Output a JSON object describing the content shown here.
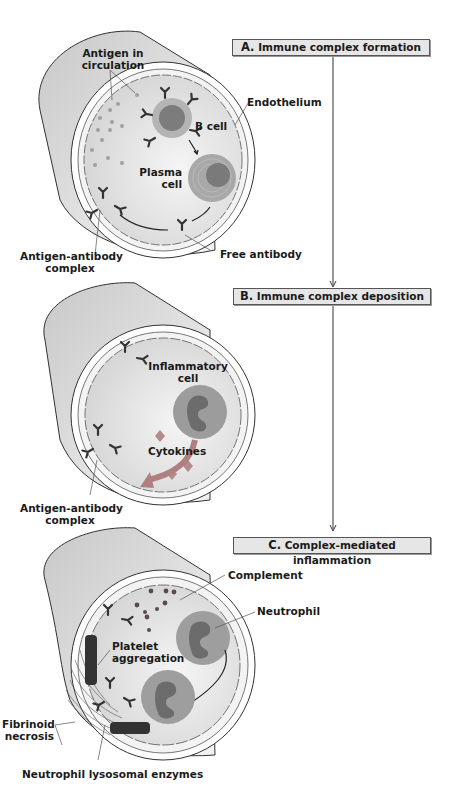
{
  "stages": [
    {
      "letter": "A.",
      "title": "Immune complex formation"
    },
    {
      "letter": "B.",
      "title": "Immune complex deposition"
    },
    {
      "letter": "C.",
      "title": "Complex-mediated inflammation"
    }
  ],
  "panel_a": {
    "labels": {
      "antigen_line1": "Antigen in",
      "antigen_line2": "circulation",
      "endothelium": "Endothelium",
      "b_cell": "B cell",
      "plasma_line1": "Plasma",
      "plasma_line2": "cell",
      "complex_line1": "Antigen-antibody",
      "complex_line2": "complex",
      "free_antibody": "Free antibody"
    }
  },
  "panel_b": {
    "labels": {
      "inflammatory_line1": "Inflammatory",
      "inflammatory_line2": "cell",
      "cytokines": "Cytokines",
      "complex_line1": "Antigen-antibody",
      "complex_line2": "complex"
    }
  },
  "panel_c": {
    "labels": {
      "complement": "Complement",
      "neutrophil": "Neutrophil",
      "platelet_line1": "Platelet",
      "platelet_line2": "aggregation",
      "fibrinoid_line1": "Fibrinoid",
      "fibrinoid_line2": "necrosis",
      "enzymes": "Neutrophil lysosomal enzymes"
    }
  },
  "colors": {
    "vessel_outer": "#d9d9d9",
    "lumen": "#e4e4e4",
    "cell": "#9a9a9a",
    "nucleus": "#6e6e6e",
    "antibody": "#333333",
    "antigen": "#a0a0a0",
    "stage_box": "#e6e6e6"
  }
}
